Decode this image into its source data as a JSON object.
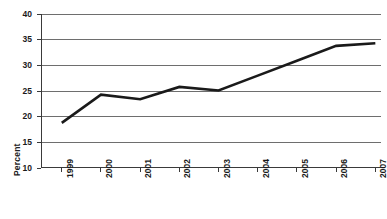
{
  "chart_data": {
    "type": "line",
    "title": "",
    "xlabel": "",
    "ylabel": "Percent",
    "categories": [
      "1999",
      "2000",
      "2001",
      "2002",
      "2003",
      "2004",
      "2005",
      "2006",
      "2007"
    ],
    "values": [
      18.8,
      24.3,
      23.4,
      25.8,
      25.1,
      28.0,
      30.9,
      33.8,
      34.3
    ],
    "series": [
      {
        "name": "Percent",
        "values": [
          18.8,
          24.3,
          23.4,
          25.8,
          25.1,
          28.0,
          30.9,
          33.8,
          34.3
        ]
      }
    ],
    "ylim": [
      10,
      40
    ],
    "yticks": [
      10,
      15,
      20,
      25,
      30,
      35,
      40
    ],
    "ytick_labels": [
      "10",
      "15",
      "20",
      "25",
      "30",
      "35",
      "40"
    ],
    "xtick_labels": [
      "1999",
      "2000",
      "2001",
      "2002",
      "2003",
      "2004",
      "2005",
      "2006",
      "2007"
    ],
    "grid": true,
    "grid_axis": "y",
    "legend": false,
    "legend_position": "none",
    "line_color": "#1a1a1a",
    "grid_color": "#6e6e6e",
    "axis_color": "#3a3a3a",
    "background_color": "#ffffff",
    "xtick_label_rotation": -90
  }
}
